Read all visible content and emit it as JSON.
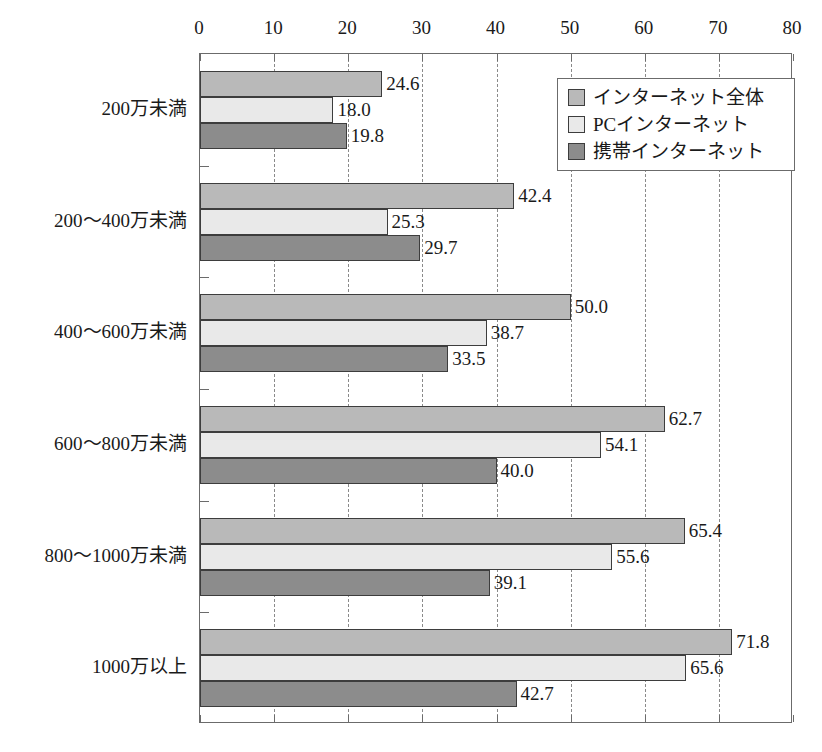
{
  "chart_data": {
    "type": "bar",
    "orientation": "horizontal",
    "title": "",
    "xlabel": "",
    "ylabel": "",
    "xlim": [
      0,
      80
    ],
    "xticks": [
      0,
      10,
      20,
      30,
      40,
      50,
      60,
      70,
      80
    ],
    "xtick_labels": [
      "0",
      "10",
      "20",
      "30",
      "40",
      "50",
      "60",
      "70",
      "80"
    ],
    "grid": "vertical-dashed",
    "legend_position": "top-right-inside",
    "categories": [
      "200万未満",
      "200～400万未満",
      "400～600万未満",
      "600～800万未満",
      "800～1000万未満",
      "1000万以上"
    ],
    "series": [
      {
        "name": "インターネット全体",
        "color": "#b9b9b9",
        "values": [
          24.6,
          42.4,
          50.0,
          62.7,
          65.4,
          71.8
        ],
        "labels": [
          "24.6",
          "42.4",
          "50.0",
          "62.7",
          "65.4",
          "71.8"
        ]
      },
      {
        "name": "PCインターネット",
        "color": "#e9e9e9",
        "values": [
          18.0,
          25.3,
          38.7,
          54.1,
          55.6,
          65.6
        ],
        "labels": [
          "18.0",
          "25.3",
          "38.7",
          "54.1",
          "55.6",
          "65.6"
        ]
      },
      {
        "name": "携帯インターネット",
        "color": "#8c8c8c",
        "values": [
          19.8,
          29.7,
          33.5,
          40.0,
          39.1,
          42.7
        ],
        "labels": [
          "19.8",
          "29.7",
          "33.5",
          "40.0",
          "39.1",
          "42.7"
        ]
      }
    ]
  },
  "legend": {
    "items": [
      {
        "label": "インターネット全体"
      },
      {
        "label": "PCインターネット"
      },
      {
        "label": "携帯インターネット"
      }
    ]
  },
  "colors": {
    "series_0": "#b9b9b9",
    "series_1": "#e9e9e9",
    "series_2": "#8c8c8c",
    "bar_border": "#3d3d3d",
    "axis": "#6b6b6b",
    "gridline": "#8a8a8a",
    "text": "#1a1a1a",
    "background": "#ffffff"
  }
}
